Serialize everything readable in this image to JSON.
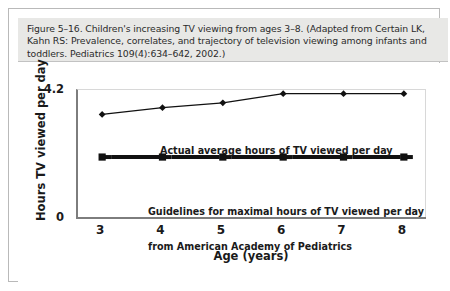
{
  "figure": {
    "caption": "Figure 5–16. Children's increasing TV viewing from ages 3–8. (Adapted from Certain LK, Kahn RS: Prevalence, correlates, and trajectory of television viewing among infants and toddlers. Pediatrics 109(4):634–642, 2002.)",
    "caption_background": "#e8e8e6",
    "border_color": "#b9b9b9"
  },
  "chart_data": {
    "type": "line",
    "title": "",
    "xlabel": "Age (years)",
    "ylabel": "Hours TV viewed per day",
    "categories": [
      "3",
      "4",
      "5",
      "6",
      "7",
      "8"
    ],
    "x": [
      3,
      4,
      5,
      6,
      7,
      8
    ],
    "xlim": [
      2.6,
      8.4
    ],
    "ylim": [
      0,
      4.2
    ],
    "ytick_labels": [
      "4.2",
      "0"
    ],
    "yticks": [
      4.2,
      0
    ],
    "grid": false,
    "legend_position": "inline-annotation",
    "series": [
      {
        "name": "Actual average hours of TV viewed per day",
        "values": [
          3.4,
          3.62,
          3.78,
          4.08,
          4.08,
          4.08
        ],
        "marker": "diamond",
        "color": "#111111",
        "line_width": 1.3
      },
      {
        "name": "Guidelines for maximal hours of TV viewed per day from American Academy of Pediatrics",
        "values": [
          2.0,
          2.0,
          2.0,
          2.0,
          2.0,
          2.0
        ],
        "marker": "square",
        "color": "#111111",
        "line_width": 4,
        "line_style": "dashed-segments"
      }
    ],
    "annotations": [
      {
        "id": "actual-label",
        "text": "Actual average hours of TV viewed per day"
      },
      {
        "id": "guidelines-label",
        "line1": "Guidelines for maximal hours of TV viewed per day",
        "line2": "from American Academy of Pediatrics"
      }
    ]
  }
}
